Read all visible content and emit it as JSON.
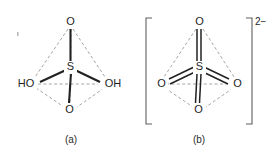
{
  "figure": {
    "background_color": "#ffffff",
    "bond_color": "#222222",
    "dashed_edge_color": "#8d8d8d",
    "bracket_color": "#5f5f5f",
    "width": 278,
    "height": 155
  },
  "structures": [
    {
      "id": "structure-a",
      "caption": "(a)",
      "center_atom": "S",
      "charge": "",
      "bracketed": false,
      "atoms": [
        {
          "name": "oxygen-apex",
          "label": "O",
          "position": "apex"
        },
        {
          "name": "hydroxyl-left",
          "label": "HO",
          "position": "front-left"
        },
        {
          "name": "hydroxyl-right",
          "label": "OH",
          "position": "front-right"
        },
        {
          "name": "oxygen-bottom",
          "label": "O",
          "position": "front-bottom"
        }
      ],
      "bonds": [
        {
          "from": "S",
          "to": "O",
          "order": 1,
          "style": "solid"
        },
        {
          "from": "S",
          "to": "HO",
          "order": 1,
          "style": "solid"
        },
        {
          "from": "S",
          "to": "OH",
          "order": 1,
          "style": "solid"
        },
        {
          "from": "S",
          "to": "O",
          "order": 1,
          "style": "solid"
        }
      ]
    },
    {
      "id": "structure-b",
      "caption": "(b)",
      "center_atom": "S",
      "charge": "2−",
      "bracketed": true,
      "atoms": [
        {
          "name": "oxygen-apex",
          "label": "O",
          "position": "apex"
        },
        {
          "name": "oxygen-left",
          "label": "O",
          "position": "front-left"
        },
        {
          "name": "oxygen-right",
          "label": "O",
          "position": "front-right"
        },
        {
          "name": "oxygen-bottom",
          "label": "O",
          "position": "front-bottom"
        }
      ],
      "bonds": [
        {
          "from": "S",
          "to": "O",
          "order": 2,
          "style": "double"
        },
        {
          "from": "S",
          "to": "O",
          "order": 2,
          "style": "double"
        },
        {
          "from": "S",
          "to": "O",
          "order": 2,
          "style": "double"
        },
        {
          "from": "S",
          "to": "O",
          "order": 2,
          "style": "double"
        }
      ]
    }
  ],
  "labels": {
    "a_apex_oxygen": "O",
    "a_center_sulfur": "S",
    "a_left_hydroxyl": "HO",
    "a_right_hydroxyl": "OH",
    "a_bottom_oxygen": "O",
    "a_caption": "(a)",
    "b_apex_oxygen": "O",
    "b_center_sulfur": "S",
    "b_left_oxygen": "O",
    "b_right_oxygen": "O",
    "b_bottom_oxygen": "O",
    "b_caption": "(b)",
    "b_charge": "2−"
  }
}
